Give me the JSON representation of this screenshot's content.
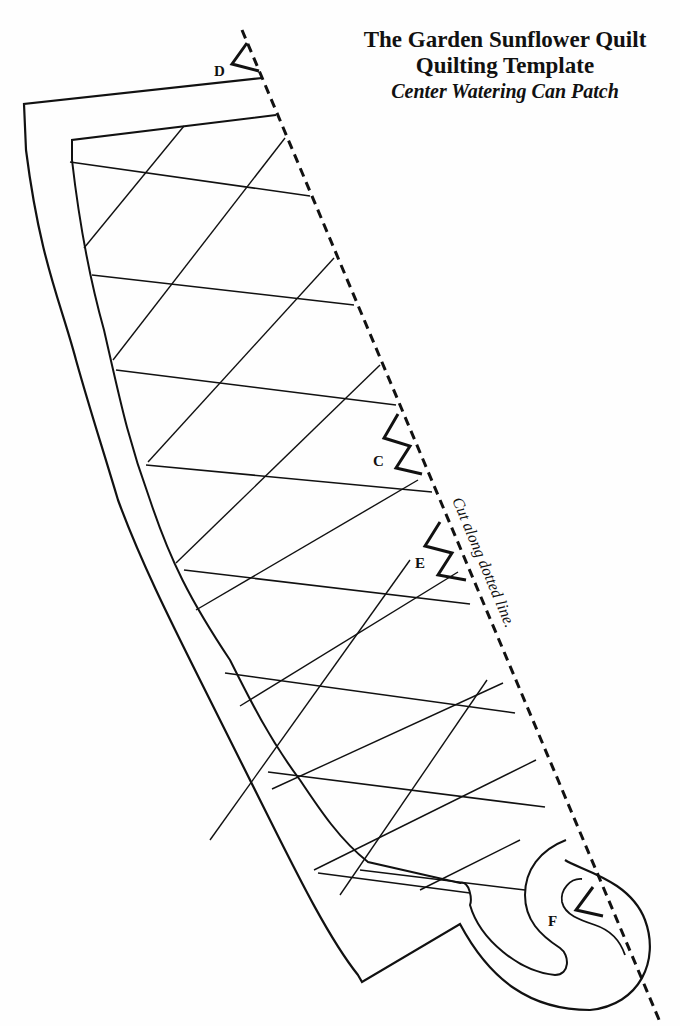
{
  "title": {
    "line1": "The Garden Sunflower Quilt",
    "line2": "Quilting Template",
    "line3": "Center Watering Can Patch"
  },
  "instructions": {
    "cut_line": "Cut along dotted line."
  },
  "notch_labels": {
    "d": "D",
    "c": "C",
    "e": "E",
    "f": "F"
  },
  "colors": {
    "ink": "#111111",
    "paper": "#fefefe"
  }
}
